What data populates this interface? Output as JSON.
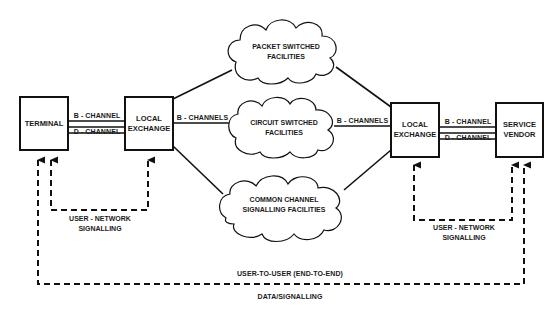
{
  "nodes": {
    "terminal": {
      "label": "TERMINAL"
    },
    "local_exchange_left": {
      "line1": "LOCAL",
      "line2": "EXCHANGE"
    },
    "local_exchange_right": {
      "line1": "LOCAL",
      "line2": "EXCHANGE"
    },
    "service_vendor": {
      "line1": "SERVICE",
      "line2": "VENDOR"
    },
    "packet_cloud": {
      "line1": "PACKET SWITCHED",
      "line2": "FACILITIES"
    },
    "circuit_cloud": {
      "line1": "CIRCUIT SWITCHED",
      "line2": "FACILITIES"
    },
    "common_cloud": {
      "line1": "COMMON CHANNEL",
      "line2": "SIGNALLING FACILITIES"
    }
  },
  "links": {
    "left_b_channel": "B - CHANNEL",
    "left_d_channel": "D - CHANNEL",
    "right_b_channel": "B - CHANNEL",
    "right_d_channel": "D - CHANNEL",
    "left_b_channels": "B - CHANNELS",
    "right_b_channels": "B - CHANNELS"
  },
  "signalling": {
    "left_user_network": {
      "line1": "USER - NETWORK",
      "line2": "SIGNALLING"
    },
    "right_user_network": {
      "line1": "USER - NETWORK",
      "line2": "SIGNALLING"
    },
    "end_to_end_top": "USER-TO-USER (END-TO-END)",
    "end_to_end_bottom": "DATA/SIGNALLING"
  },
  "colors": {
    "stroke": "#111111",
    "background": "#ffffff"
  }
}
